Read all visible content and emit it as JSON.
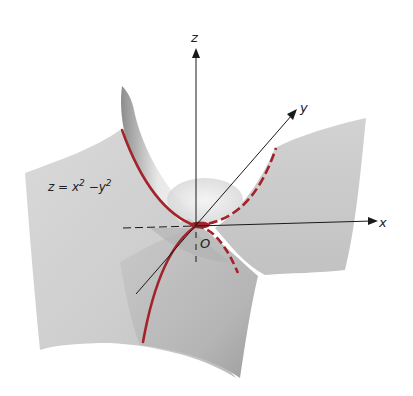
{
  "figure": {
    "surface_equation": {
      "lhs": "z = x",
      "x_exp": "2",
      "middle": " −y",
      "y_exp": "2"
    },
    "axes": {
      "x_label": "x",
      "y_label": "y",
      "z_label": "z",
      "origin_label": "O"
    },
    "colors": {
      "surface_light": "#e6e6e6",
      "surface_mid": "#cfcfcf",
      "surface_dark": "#a9a9a9",
      "trace_curve": "#a3232a",
      "axis": "#1a1a1a",
      "background": "#ffffff"
    }
  }
}
